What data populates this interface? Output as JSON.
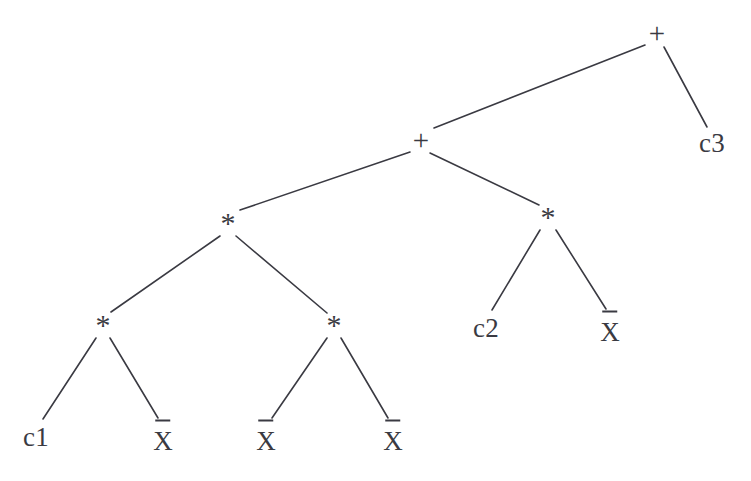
{
  "diagram": {
    "type": "binary-expression-tree",
    "background_color": "#ffffff",
    "ink_color": "#3a3a42",
    "expression": "((c1 * X̄) * (X̄ * X̄)) + (c2 * X̄) + c3",
    "nodes": [
      {
        "id": "n-root-plus",
        "label": "+",
        "kind": "operator",
        "x": 657,
        "y": 33,
        "clipped": false
      },
      {
        "id": "n-c3",
        "label": "c3",
        "kind": "leaf",
        "x": 712,
        "y": 143,
        "clipped": true
      },
      {
        "id": "n-plus-2",
        "label": "+",
        "kind": "operator",
        "x": 421,
        "y": 140,
        "clipped": false
      },
      {
        "id": "n-times-left",
        "label": "*",
        "kind": "operator",
        "x": 228,
        "y": 223,
        "clipped": false
      },
      {
        "id": "n-times-right",
        "label": "*",
        "kind": "operator",
        "x": 548,
        "y": 217,
        "clipped": false
      },
      {
        "id": "n-times-ll",
        "label": "*",
        "kind": "operator",
        "x": 103,
        "y": 325,
        "clipped": false
      },
      {
        "id": "n-times-lr",
        "label": "*",
        "kind": "operator",
        "x": 334,
        "y": 325,
        "clipped": false
      },
      {
        "id": "n-c2",
        "label": "c2",
        "kind": "leaf",
        "x": 486,
        "y": 328,
        "clipped": false
      },
      {
        "id": "n-xbar-r",
        "label": "X",
        "kind": "leaf-bar",
        "x": 610,
        "y": 328,
        "clipped": false
      },
      {
        "id": "n-c1",
        "label": "c1",
        "kind": "leaf",
        "x": 36,
        "y": 437,
        "clipped": false
      },
      {
        "id": "n-xbar-1",
        "label": "X",
        "kind": "leaf-bar",
        "x": 163,
        "y": 437,
        "clipped": false
      },
      {
        "id": "n-xbar-2",
        "label": "X",
        "kind": "leaf-bar",
        "x": 266,
        "y": 437,
        "clipped": false
      },
      {
        "id": "n-xbar-3",
        "label": "X",
        "kind": "leaf-bar",
        "x": 393,
        "y": 437,
        "clipped": false
      }
    ],
    "edges": [
      {
        "id": "e-root-plus2",
        "from": "n-root-plus",
        "to": "n-plus-2",
        "x1": 645,
        "y1": 45,
        "x2": 434,
        "y2": 128
      },
      {
        "id": "e-root-c3",
        "from": "n-root-plus",
        "to": "n-c3",
        "x1": 664,
        "y1": 47,
        "x2": 707,
        "y2": 127
      },
      {
        "id": "e-plus2-timesleft",
        "from": "n-plus-2",
        "to": "n-times-left",
        "x1": 410,
        "y1": 152,
        "x2": 240,
        "y2": 210
      },
      {
        "id": "e-plus2-timesright",
        "from": "n-plus-2",
        "to": "n-times-right",
        "x1": 430,
        "y1": 153,
        "x2": 539,
        "y2": 205
      },
      {
        "id": "e-left-ll",
        "from": "n-times-left",
        "to": "n-times-ll",
        "x1": 220,
        "y1": 236,
        "x2": 111,
        "y2": 312
      },
      {
        "id": "e-left-lr",
        "from": "n-times-left",
        "to": "n-times-lr",
        "x1": 236,
        "y1": 236,
        "x2": 327,
        "y2": 313
      },
      {
        "id": "e-right-c2",
        "from": "n-times-right",
        "to": "n-c2",
        "x1": 540,
        "y1": 230,
        "x2": 492,
        "y2": 310
      },
      {
        "id": "e-right-xbar",
        "from": "n-times-right",
        "to": "n-xbar-r",
        "x1": 556,
        "y1": 230,
        "x2": 606,
        "y2": 309
      },
      {
        "id": "e-ll-c1",
        "from": "n-times-ll",
        "to": "n-c1",
        "x1": 96,
        "y1": 338,
        "x2": 43,
        "y2": 419
      },
      {
        "id": "e-ll-xbar1",
        "from": "n-times-ll",
        "to": "n-xbar-1",
        "x1": 110,
        "y1": 338,
        "x2": 158,
        "y2": 418
      },
      {
        "id": "e-lr-xbar2",
        "from": "n-times-lr",
        "to": "n-xbar-2",
        "x1": 327,
        "y1": 338,
        "x2": 272,
        "y2": 418
      },
      {
        "id": "e-lr-xbar3",
        "from": "n-times-lr",
        "to": "n-xbar-3",
        "x1": 341,
        "y1": 338,
        "x2": 388,
        "y2": 418
      }
    ]
  }
}
